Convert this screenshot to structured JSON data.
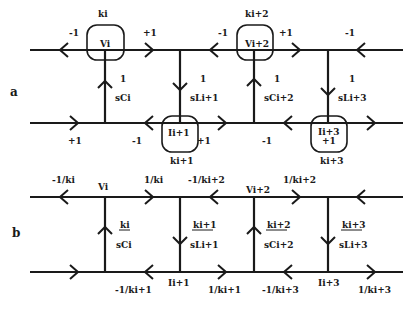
{
  "part_a": {
    "label": "a",
    "nodes": {
      "vi": {
        "name": "Vi",
        "gain": "ki"
      },
      "ii1": {
        "name": "Ii+1",
        "gain": "ki+1"
      },
      "vi2": {
        "name": "Vi+2",
        "gain": "ki+2"
      },
      "ii3": {
        "name": "Ii+3",
        "gain": "ki+3",
        "extra": "+1"
      }
    },
    "top_edges": [
      "-1",
      "+1",
      "-1",
      "+1",
      "-1"
    ],
    "bottom_edges": [
      "+1",
      "-1",
      "+1",
      "-1"
    ],
    "branches": [
      {
        "num": "1",
        "den": "sCi"
      },
      {
        "num": "1",
        "den": "sLi+1"
      },
      {
        "num": "1",
        "den": "sCi+2"
      },
      {
        "num": "1",
        "den": "sLi+3"
      }
    ]
  },
  "part_b": {
    "label": "b",
    "nodes": {
      "vi": "Vi",
      "vi2": "Vi+2",
      "ii1": "Ii+1",
      "ii3": "Ii+3"
    },
    "top_edges": [
      "-1/ki",
      "1/ki",
      "-1/ki+2",
      "1/ki+2"
    ],
    "bottom_edges": [
      "-1/ki+1",
      "1/ki+1",
      "-1/ki+3",
      "1/ki+3"
    ],
    "branches": [
      {
        "num": "ki",
        "den": "sCi"
      },
      {
        "num": "ki+1",
        "den": "sLi+1"
      },
      {
        "num": "ki+2",
        "den": "sCi+2"
      },
      {
        "num": "ki+3",
        "den": "sLi+3"
      }
    ]
  }
}
